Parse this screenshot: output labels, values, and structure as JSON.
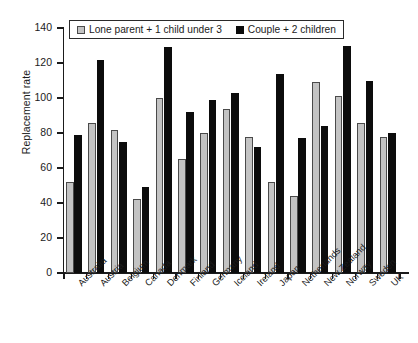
{
  "chart_data": {
    "type": "bar",
    "title": "",
    "subtitle": "",
    "xlabel": "",
    "ylabel": "Replacement rate",
    "ylim": [
      0,
      140
    ],
    "yticks": [
      0,
      20,
      40,
      60,
      80,
      100,
      120,
      140
    ],
    "grid": false,
    "legend_position": "top-left-inside",
    "categories": [
      "Australia",
      "Austria",
      "Belgium",
      "Canada",
      "Denmark",
      "Finland",
      "Germany",
      "Iceland",
      "Ireland",
      "Japan",
      "Netherlands",
      "New Zealand",
      "Norway",
      "Sweden",
      "UK"
    ],
    "series": [
      {
        "name": "Lone parent + 1 child under 3",
        "color": "#c3c3c3",
        "values": [
          52,
          86,
          82,
          42.5,
          100,
          65,
          80,
          94,
          78,
          52,
          44,
          109,
          101,
          86,
          78
        ]
      },
      {
        "name": "Couple + 2 children",
        "color": "#0c0c0c",
        "values": [
          79,
          122,
          75,
          49,
          129,
          92,
          99,
          103,
          72,
          113.5,
          77,
          84,
          130,
          110,
          80
        ]
      }
    ]
  },
  "axes": {
    "y_title": "Replacement rate",
    "y_tick_labels": [
      "0",
      "20",
      "40",
      "60",
      "80",
      "100",
      "120",
      "140"
    ]
  },
  "legend": {
    "entries": [
      {
        "label": "Lone parent + 1 child under 3",
        "swatch": "grey-swatch-icon"
      },
      {
        "label": "Couple + 2 children",
        "swatch": "black-swatch-icon"
      }
    ]
  }
}
